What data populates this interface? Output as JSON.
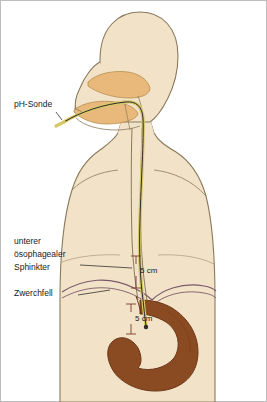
{
  "figure": {
    "labels": [
      {
        "id": "ph-sonde",
        "text": "pH-Sonde",
        "x": 14,
        "y": 104
      },
      {
        "id": "unterer-oesophagealer-sphinkter-line1",
        "text": "unterer",
        "x": 14,
        "y": 241
      },
      {
        "id": "unterer-oesophagealer-sphinkter-line2",
        "text": "ösophagealer",
        "x": 14,
        "y": 254
      },
      {
        "id": "unterer-oesophagealer-sphinkter-line3",
        "text": "Sphinkter",
        "x": 14,
        "y": 267
      },
      {
        "id": "zwerchfell",
        "text": "Zwerchfell",
        "x": 14,
        "y": 292
      }
    ],
    "measurements": [
      {
        "id": "measurement-upper",
        "text": "5 cm",
        "x": 136,
        "y": 270
      },
      {
        "id": "measurement-lower",
        "text": "5 cm",
        "x": 131,
        "y": 318
      }
    ],
    "colors": {
      "body_fill": "#f2e2c8",
      "body_outline": "#7a6a50",
      "tongue_mouth": "#e8b97a",
      "stomach_fill": "#8a4a22",
      "probe_line": "#2b2b2b",
      "probe_tube": "#d8c86a",
      "background": "#ffffff",
      "border": "#bdbdbd",
      "text": "#1a1a1a"
    }
  }
}
